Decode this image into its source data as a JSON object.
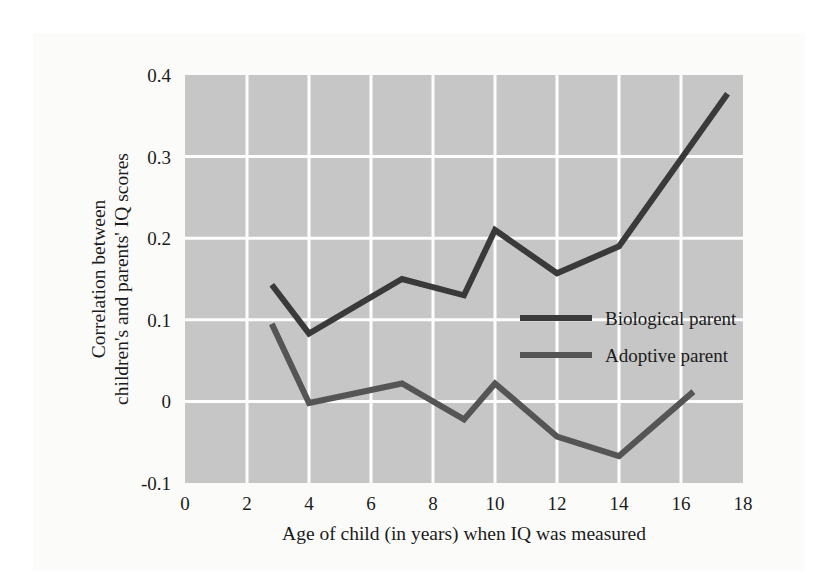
{
  "chart_data": {
    "type": "line",
    "title": "",
    "subtitle": "",
    "xlabel": "Age of child (in years) when IQ was measured",
    "ylabel": "Correlation between children's and parents' IQ scores",
    "ylabel_line1": "Correlation between",
    "ylabel_line2": "children's and parents' IQ scores",
    "xlim": [
      0,
      18
    ],
    "ylim": [
      -0.1,
      0.4
    ],
    "xticks": [
      0,
      2,
      4,
      6,
      8,
      10,
      12,
      14,
      16,
      18
    ],
    "xtick_labels": [
      "0",
      "2",
      "4",
      "6",
      "8",
      "10",
      "12",
      "14",
      "16",
      "18"
    ],
    "yticks": [
      -0.1,
      0,
      0.1,
      0.2,
      0.3,
      0.4
    ],
    "ytick_labels": [
      "-0.1",
      "0",
      "0.1",
      "0.2",
      "0.3",
      "0.4"
    ],
    "grid": true,
    "legend_position": "center-right",
    "plot_background_color": "#c6c6c6",
    "grid_color": "#fdfdfd",
    "series": [
      {
        "name": "Biological parent",
        "color": "#3a3a3a",
        "line_width": 6,
        "x": [
          2.8,
          4.0,
          7.0,
          9.0,
          10.0,
          12.0,
          14.0,
          17.5
        ],
        "values": [
          0.143,
          0.083,
          0.15,
          0.13,
          0.21,
          0.157,
          0.19,
          0.377
        ]
      },
      {
        "name": "Adoptive parent",
        "color": "#555555",
        "line_width": 6,
        "x": [
          2.8,
          4.0,
          7.0,
          9.0,
          10.0,
          12.0,
          14.0,
          16.4
        ],
        "values": [
          0.095,
          -0.002,
          0.022,
          -0.022,
          0.022,
          -0.043,
          -0.067,
          0.012
        ]
      }
    ],
    "legend": [
      {
        "label": "Biological parent",
        "color": "#3a3a3a"
      },
      {
        "label": "Adoptive parent",
        "color": "#555555"
      }
    ]
  }
}
